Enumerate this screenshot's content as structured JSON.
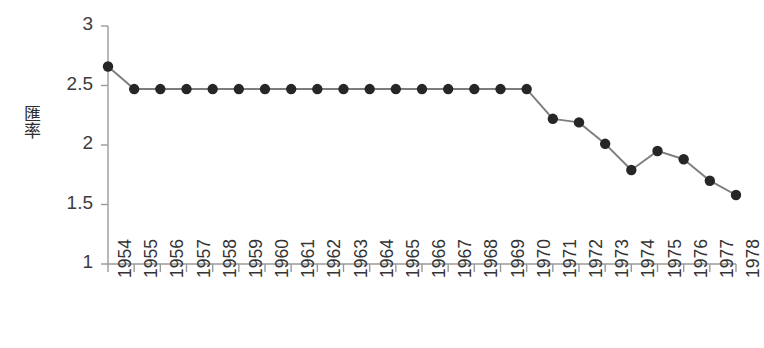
{
  "chart_data": {
    "type": "line",
    "title": "",
    "xlabel": "",
    "ylabel": "匯率",
    "ylabel_chars": [
      "匯",
      "率"
    ],
    "categories": [
      "1954",
      "1955",
      "1956",
      "1957",
      "1958",
      "1959",
      "1960",
      "1961",
      "1962",
      "1963",
      "1964",
      "1965",
      "1966",
      "1967",
      "1968",
      "1969",
      "1970",
      "1971",
      "1972",
      "1973",
      "1974",
      "1975",
      "1976",
      "1977",
      "1978"
    ],
    "values": [
      2.66,
      2.47,
      2.47,
      2.47,
      2.47,
      2.47,
      2.47,
      2.47,
      2.47,
      2.47,
      2.47,
      2.47,
      2.47,
      2.47,
      2.47,
      2.47,
      2.47,
      2.22,
      2.19,
      2.01,
      1.79,
      1.95,
      1.88,
      1.7,
      1.58
    ],
    "ylim": [
      1,
      3
    ],
    "yticks": [
      3,
      2.5,
      2,
      1.5,
      1
    ],
    "ytick_labels": [
      "3",
      "2.5",
      "2",
      "1.5",
      "1"
    ],
    "grid": false,
    "legend": null,
    "marker": "filled-circle",
    "marker_color": "#262626",
    "line_color": "#7d7d7d",
    "axis_color": "#9a9a9a",
    "background": "#ffffff"
  }
}
